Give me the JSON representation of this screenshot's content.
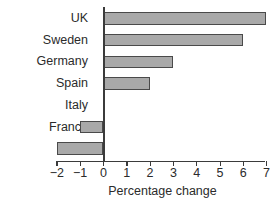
{
  "chart_data": {
    "type": "bar",
    "orientation": "horizontal",
    "title": "",
    "xlabel": "Percentage change",
    "ylabel": "",
    "categories": [
      "UK",
      "Sweden",
      "Germany",
      "Spain",
      "Italy",
      "France",
      "NL"
    ],
    "values": [
      7,
      6,
      3,
      2,
      0,
      -1,
      -2
    ],
    "xlim": [
      -2,
      7
    ],
    "xticks": [
      -2,
      -1,
      0,
      1,
      2,
      3,
      4,
      5,
      6,
      7
    ],
    "xtick_labels": [
      "−2",
      "−1",
      "0",
      "1",
      "2",
      "3",
      "4",
      "5",
      "6",
      "7"
    ],
    "grid": false,
    "legend": false,
    "bar_fill_color": "#a9a9a9",
    "bar_edge_color": "#4a4a4a",
    "axis_color": "#3b3b3b",
    "text_color": "#2b2b2b",
    "background_color": "#ffffff"
  }
}
